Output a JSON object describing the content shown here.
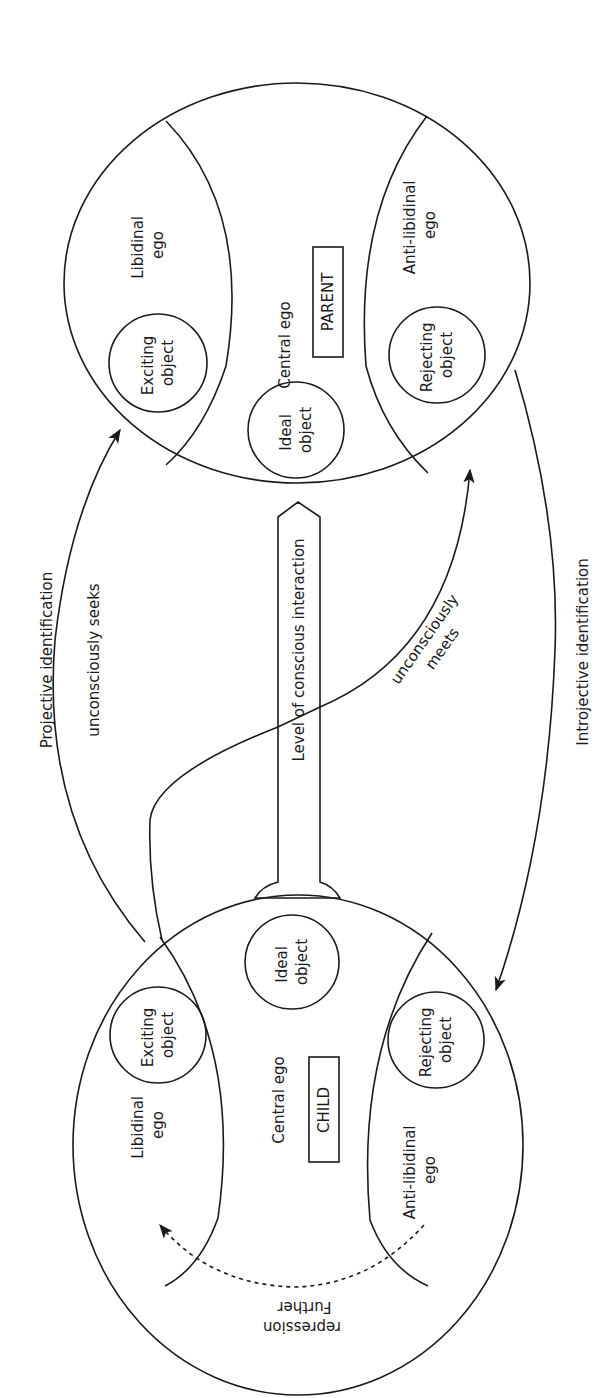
{
  "diagram": {
    "orientation": "rotated-90-ccw",
    "colors": {
      "ink": "#1a1a1a",
      "background": "#ffffff"
    },
    "parent": {
      "box_label": "PARENT",
      "central": "Central ego",
      "libidinal": [
        "Libidinal",
        "ego"
      ],
      "anti_libidinal": [
        "Anti-libidinal",
        "ego"
      ],
      "exciting": [
        "Exciting",
        "object"
      ],
      "ideal": [
        "Ideal",
        "object"
      ],
      "rejecting": [
        "Rejecting",
        "object"
      ]
    },
    "child": {
      "box_label": "CHILD",
      "central": "Central ego",
      "libidinal": [
        "Libidinal",
        "ego"
      ],
      "anti_libidinal": [
        "Anti-libidinal",
        "ego"
      ],
      "exciting": [
        "Exciting",
        "object"
      ],
      "ideal": [
        "Ideal",
        "object"
      ],
      "rejecting": [
        "Rejecting",
        "object"
      ],
      "repression": [
        "Further",
        "repression"
      ]
    },
    "channel": {
      "label": "Level of conscious interaction"
    },
    "arrows": {
      "projective": "Projective identification",
      "seeks": "unconsciously seeks",
      "meets": [
        "unconsciously",
        "meets"
      ],
      "introjective": "Introjective identification"
    }
  }
}
